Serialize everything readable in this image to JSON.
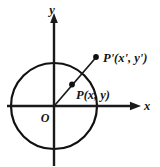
{
  "figure": {
    "background_color": "#ffffff",
    "stroke_color": "#141414",
    "axes": {
      "x_label": "x",
      "y_label": "y",
      "origin_label": "O",
      "x_axis_name": "horizontal axis",
      "y_axis_name": "vertical axis"
    },
    "circle": {
      "center_label": "O",
      "center": [
        54,
        106
      ],
      "radius": 43
    },
    "points": [
      {
        "id": "P",
        "label": "P(x, y)",
        "x": 72,
        "y": 84,
        "on_circle": true
      },
      {
        "id": "Pprime",
        "label": "P'(x', y')",
        "x": 96,
        "y": 57,
        "on_circle": false
      }
    ],
    "ray": {
      "from": "O",
      "through": "P",
      "to": "P'"
    }
  }
}
